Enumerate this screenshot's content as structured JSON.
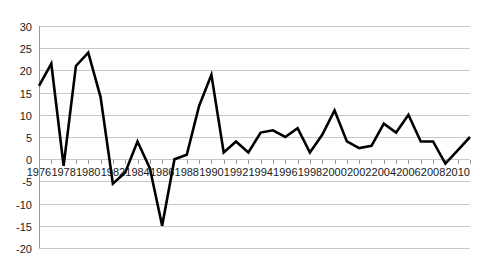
{
  "chart_data": {
    "type": "line",
    "title": "",
    "subtitle": "",
    "xlabel": "",
    "ylabel": "",
    "xlim": [
      1976,
      2011
    ],
    "ylim": [
      -20,
      30
    ],
    "ytick_step": 5,
    "yticks": [
      30,
      25,
      20,
      15,
      10,
      5,
      0,
      -5,
      -10,
      -15,
      -20
    ],
    "ytick_labels": [
      "30",
      "25",
      "20",
      "15",
      "10",
      "5",
      "0",
      "-5",
      "-10",
      "-15",
      "-20"
    ],
    "xticks": [
      1976,
      1978,
      1980,
      1982,
      1984,
      1986,
      1988,
      1990,
      1992,
      1994,
      1996,
      1998,
      2000,
      2002,
      2004,
      2006,
      2008,
      2010
    ],
    "xtick_labels": [
      "1976",
      "1978",
      "1980",
      "1982",
      "1984",
      "1986",
      "1988",
      "1990",
      "1992",
      "1994",
      "1996",
      "1998",
      "2000",
      "2002",
      "2004",
      "2006",
      "2008",
      "2010"
    ],
    "x": [
      1976,
      1977,
      1978,
      1979,
      1980,
      1981,
      1982,
      1983,
      1984,
      1985,
      1986,
      1987,
      1988,
      1989,
      1990,
      1991,
      1992,
      1993,
      1994,
      1995,
      1996,
      1997,
      1998,
      1999,
      2000,
      2001,
      2002,
      2003,
      2004,
      2005,
      2006,
      2007,
      2008,
      2009,
      2010,
      2011
    ],
    "values": [
      16.5,
      21.5,
      -1.5,
      21,
      24,
      14,
      -5.5,
      -3,
      4,
      -2,
      -15,
      0,
      1,
      12,
      19,
      1.5,
      4,
      1.5,
      6,
      6.5,
      5,
      7,
      1.5,
      5.5,
      11,
      4,
      2.5,
      3,
      8,
      6,
      10,
      4,
      4,
      -1,
      2,
      5
    ],
    "series": [
      {
        "name": "series-1",
        "color": "#000000",
        "values": [
          16.5,
          21.5,
          -1.5,
          21,
          24,
          14,
          -5.5,
          -3,
          4,
          -2,
          -15,
          0,
          1,
          12,
          19,
          1.5,
          4,
          1.5,
          6,
          6.5,
          5,
          7,
          1.5,
          5.5,
          11,
          4,
          2.5,
          3,
          8,
          6,
          10,
          4,
          4,
          -1,
          2,
          5
        ]
      }
    ],
    "grid": {
      "horizontal": true,
      "vertical": false,
      "color": "#c8c8c8"
    },
    "legend": {
      "visible": false,
      "position": "none",
      "entries": []
    },
    "annotations": [],
    "background_color": "#ffffff",
    "line_color": "#000000",
    "axis_color": "#9a9a9a"
  }
}
